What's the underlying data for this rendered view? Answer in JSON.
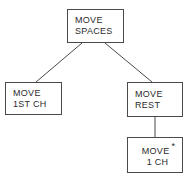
{
  "diagram": {
    "type": "tree",
    "stroke_color": "#4a4a4a",
    "text_color": "#2b2b2b",
    "background_color": "#ffffff",
    "nodes": [
      {
        "id": "move-spaces",
        "line1": "MOVE",
        "line2": "SPACES",
        "marker": "",
        "level": 0
      },
      {
        "id": "move-1st-ch",
        "line1": "MOVE",
        "line2": "1ST CH",
        "marker": "",
        "level": 1
      },
      {
        "id": "move-rest",
        "line1": "MOVE",
        "line2": "REST",
        "marker": "",
        "level": 1
      },
      {
        "id": "move-1-ch",
        "line1": "MOVE",
        "line2": "1 CH",
        "marker": "*",
        "level": 2
      }
    ],
    "edges": [
      {
        "from": "move-spaces",
        "to": "move-1st-ch",
        "style": "diagonal"
      },
      {
        "from": "move-spaces",
        "to": "move-rest",
        "style": "diagonal"
      },
      {
        "from": "move-rest",
        "to": "move-1-ch",
        "style": "vertical"
      }
    ]
  }
}
